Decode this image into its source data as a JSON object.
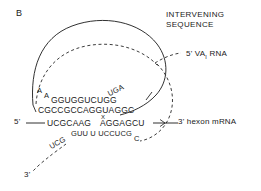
{
  "figure": {
    "panel_label": "B",
    "background": "#ffffff",
    "ink": "#1a1a1a"
  },
  "annotations": {
    "intervening_sequence_line1": "INTERVENING",
    "intervening_sequence_line2": "SEQUENCE",
    "va_rna_label": "5' VA",
    "va_rna_subscript": "I",
    "va_rna_label_tail": " RNA",
    "hexon_mrna_label": "3' hexon mRNA",
    "five_prime": "5'",
    "three_prime": "3'",
    "splice_mark": "X"
  },
  "sequences": {
    "top_loop_left_bases": "A",
    "top_loop_left_bases2": "A",
    "top_strand": "GGUGGUCUGG",
    "top_right_raised": "UGA",
    "second_strand": "CGCCGCCAGGUAGGC",
    "mrna_strand_left": "UCGCAAG",
    "mrna_strand_right": "AGGAGCU",
    "bottom_strand": "GUU U UCCUCG",
    "bottom_right_base": "C",
    "tail_bases": "UCG"
  },
  "icons": {
    "intervening_loop": "solid-loop-curve",
    "va_rna_curve": "dashed-loop-curve",
    "arrow_hexon": "arrow-right-icon"
  }
}
